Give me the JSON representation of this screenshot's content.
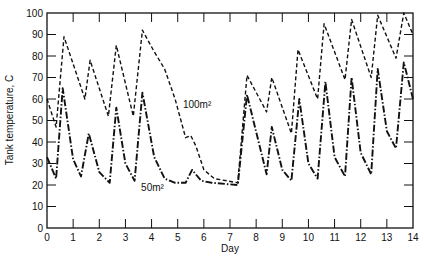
{
  "chart_data": {
    "type": "line",
    "title": "",
    "xlabel": "Day",
    "ylabel": "Tank temperature, C",
    "xlim": [
      0,
      14
    ],
    "ylim": [
      0,
      100
    ],
    "grid": false,
    "xticks": [
      0,
      1,
      2,
      3,
      4,
      5,
      6,
      7,
      8,
      9,
      10,
      11,
      12,
      13,
      14
    ],
    "yticks": [
      0,
      10,
      20,
      30,
      40,
      50,
      60,
      70,
      80,
      90,
      100
    ],
    "xtick_labels": [
      "0",
      "1",
      "2",
      "3",
      "4",
      "5",
      "6",
      "7",
      "8",
      "9",
      "10",
      "11",
      "12",
      "13",
      "14"
    ],
    "ytick_labels": [
      "0",
      "10",
      "20",
      "30",
      "40",
      "50",
      "60",
      "70",
      "80",
      "90",
      "100"
    ],
    "series": [
      {
        "name": "100m²",
        "style": "dashed",
        "points": [
          [
            0,
            60
          ],
          [
            0.35,
            47
          ],
          [
            0.65,
            89
          ],
          [
            1.45,
            60
          ],
          [
            1.65,
            78
          ],
          [
            2.35,
            52
          ],
          [
            2.65,
            85
          ],
          [
            3.3,
            52
          ],
          [
            3.65,
            92
          ],
          [
            4.1,
            82
          ],
          [
            4.5,
            74
          ],
          [
            4.9,
            60
          ],
          [
            5.3,
            42
          ],
          [
            5.5,
            43
          ],
          [
            5.7,
            38
          ],
          [
            6.0,
            27
          ],
          [
            6.4,
            23
          ],
          [
            7.3,
            21
          ],
          [
            7.65,
            71
          ],
          [
            8.4,
            54
          ],
          [
            8.6,
            70
          ],
          [
            9.35,
            44
          ],
          [
            9.6,
            83
          ],
          [
            10.35,
            60
          ],
          [
            10.6,
            95
          ],
          [
            11.4,
            69
          ],
          [
            11.65,
            97
          ],
          [
            12.4,
            70
          ],
          [
            12.65,
            99
          ],
          [
            13.35,
            79
          ],
          [
            13.65,
            100
          ],
          [
            14,
            90
          ]
        ]
      },
      {
        "name": "50m²",
        "style": "dash-dot",
        "points": [
          [
            0,
            33
          ],
          [
            0.35,
            23
          ],
          [
            0.6,
            65
          ],
          [
            1.0,
            32
          ],
          [
            1.3,
            24
          ],
          [
            1.6,
            44
          ],
          [
            2.0,
            26
          ],
          [
            2.4,
            21
          ],
          [
            2.65,
            56
          ],
          [
            3.0,
            30
          ],
          [
            3.35,
            22
          ],
          [
            3.65,
            63
          ],
          [
            4.1,
            33
          ],
          [
            4.5,
            23
          ],
          [
            4.9,
            21
          ],
          [
            5.3,
            21
          ],
          [
            5.55,
            27
          ],
          [
            5.9,
            22
          ],
          [
            6.3,
            21
          ],
          [
            7.3,
            20
          ],
          [
            7.65,
            62
          ],
          [
            8.4,
            25
          ],
          [
            8.6,
            47
          ],
          [
            9.0,
            27
          ],
          [
            9.35,
            22
          ],
          [
            9.65,
            60
          ],
          [
            10.0,
            30
          ],
          [
            10.35,
            23
          ],
          [
            10.65,
            68
          ],
          [
            11.0,
            33
          ],
          [
            11.4,
            24
          ],
          [
            11.65,
            70
          ],
          [
            12.0,
            35
          ],
          [
            12.4,
            25
          ],
          [
            12.65,
            74
          ],
          [
            13.0,
            45
          ],
          [
            13.35,
            37
          ],
          [
            13.65,
            77
          ],
          [
            14,
            60
          ]
        ]
      }
    ],
    "annotations": [
      {
        "text": "100m²",
        "x": 5.2,
        "y": 56
      },
      {
        "text": "50m²",
        "x": 3.6,
        "y": 17
      }
    ]
  }
}
